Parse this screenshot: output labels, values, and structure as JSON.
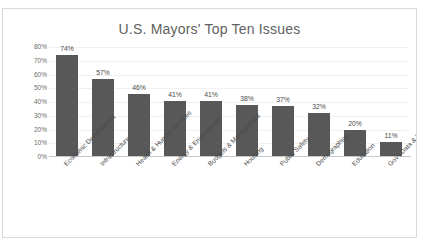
{
  "chart_data": {
    "type": "bar",
    "title": "U.S. Mayors' Top Ten Issues",
    "xlabel": "",
    "ylabel": "",
    "ylim": [
      0,
      80
    ],
    "grid": true,
    "legend": "none",
    "orientation": "vertical",
    "bar_color": "#585858",
    "categories": [
      "Economic Development",
      "Infrastructure",
      "Health & Human Services",
      "Energy & Environment",
      "Budgets & Management",
      "Housing",
      "Public Safety",
      "Demographics",
      "Education",
      "Gov't Data & Technology"
    ],
    "values": [
      74,
      57,
      46,
      41,
      41,
      38,
      37,
      32,
      20,
      11
    ],
    "data_labels": [
      "74%",
      "57%",
      "46%",
      "41%",
      "41%",
      "38%",
      "37%",
      "32%",
      "20%",
      "11%"
    ],
    "y_ticks": [
      0,
      10,
      20,
      30,
      40,
      50,
      60,
      70,
      80
    ],
    "y_tick_labels": [
      "0%",
      "10%",
      "20%",
      "30%",
      "40%",
      "50%",
      "60%",
      "70%",
      "80%"
    ]
  }
}
